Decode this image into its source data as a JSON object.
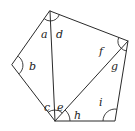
{
  "diagram": {
    "type": "pentagon-triangulation",
    "vertices": {
      "top": [
        50,
        11
      ],
      "right": [
        128,
        41
      ],
      "bottom_right": [
        115,
        121
      ],
      "bottom": [
        55,
        121
      ],
      "left": [
        12,
        65
      ]
    },
    "diagonals": [
      [
        "bottom",
        "top"
      ],
      [
        "bottom",
        "right"
      ]
    ],
    "angle_labels": [
      {
        "id": "a",
        "text": "a",
        "x": 41,
        "y": 38
      },
      {
        "id": "d",
        "text": "d",
        "x": 56,
        "y": 38
      },
      {
        "id": "b",
        "text": "b",
        "x": 29,
        "y": 70
      },
      {
        "id": "f",
        "text": "f",
        "x": 99,
        "y": 55
      },
      {
        "id": "g",
        "text": "g",
        "x": 111,
        "y": 70
      },
      {
        "id": "c",
        "text": "c",
        "x": 44,
        "y": 111
      },
      {
        "id": "e",
        "text": "e",
        "x": 57,
        "y": 111
      },
      {
        "id": "h",
        "text": "h",
        "x": 74,
        "y": 119
      },
      {
        "id": "i",
        "text": "i",
        "x": 99,
        "y": 106
      }
    ],
    "stroke_color": "#2a2a2a"
  }
}
